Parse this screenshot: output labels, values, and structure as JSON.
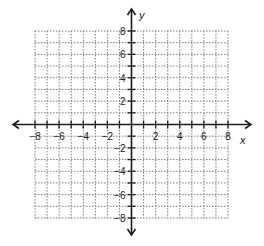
{
  "chart_data": {
    "type": "coordinate-plane",
    "title": "",
    "xlabel": "x",
    "ylabel": "y",
    "xlim": [
      -8,
      8
    ],
    "ylim": [
      -8,
      8
    ],
    "grid": true,
    "grid_step": 1,
    "grid_style": "dotted",
    "x_tick_labels": [
      "-8",
      "-6",
      "-4",
      "-2",
      "2",
      "4",
      "6",
      "8"
    ],
    "y_tick_labels": [
      "8",
      "6",
      "4",
      "2",
      "-2",
      "-4",
      "-6",
      "-8"
    ],
    "series": []
  },
  "axes": {
    "x_label": "x",
    "y_label": "y"
  },
  "colors": {
    "axis": "#1a1a1a",
    "grid": "#7a7a7a",
    "background": "#ffffff"
  }
}
